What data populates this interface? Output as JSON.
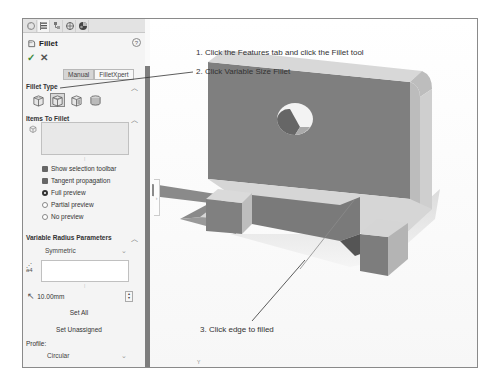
{
  "panel": {
    "tabs": [
      {
        "name": "featuremanager",
        "icon": "feature-tree-icon"
      },
      {
        "name": "propertymanager",
        "icon": "property-manager-icon",
        "active": true
      },
      {
        "name": "configurationmanager",
        "icon": "configuration-icon"
      },
      {
        "name": "dimxpertmanager",
        "icon": "dimxpert-icon"
      },
      {
        "name": "displaymanager",
        "icon": "display-manager-icon"
      }
    ],
    "title": "Fillet",
    "help_label": "?",
    "ok_label": "✓",
    "cancel_label": "✕",
    "modes": {
      "manual": "Manual",
      "filletxpert": "FilletXpert",
      "active": "Manual"
    },
    "fillet_type": {
      "header": "Fillet Type",
      "options": [
        "Constant Size Fillet",
        "Variable Size Fillet",
        "Face Fillet",
        "Full Round Fillet"
      ],
      "selected": "Variable Size Fillet"
    },
    "items_to_fillet": {
      "header": "Items To Fillet",
      "options": [
        {
          "type": "checkbox",
          "label": "Show selection toolbar",
          "checked": true
        },
        {
          "type": "checkbox",
          "label": "Tangent propagation",
          "checked": true
        },
        {
          "type": "radio",
          "label": "Full preview",
          "checked": true
        },
        {
          "type": "radio",
          "label": "Partial preview",
          "checked": false
        },
        {
          "type": "radio",
          "label": "No preview",
          "checked": false
        }
      ]
    },
    "variable_radius": {
      "header": "Variable Radius Parameters",
      "symmetric": "Symmetric",
      "radius_value": "10.00mm",
      "set_all": "Set All",
      "set_unassigned": "Set Unassigned",
      "profile_label": "Profile:",
      "profile_value": "Circular"
    }
  },
  "viewport": {
    "triad_label": "Y"
  },
  "callouts": [
    "1. Click the Features tab and click the Fillet tool",
    "2. Click Variable Size Fillet",
    "3. Click edge to filled"
  ]
}
